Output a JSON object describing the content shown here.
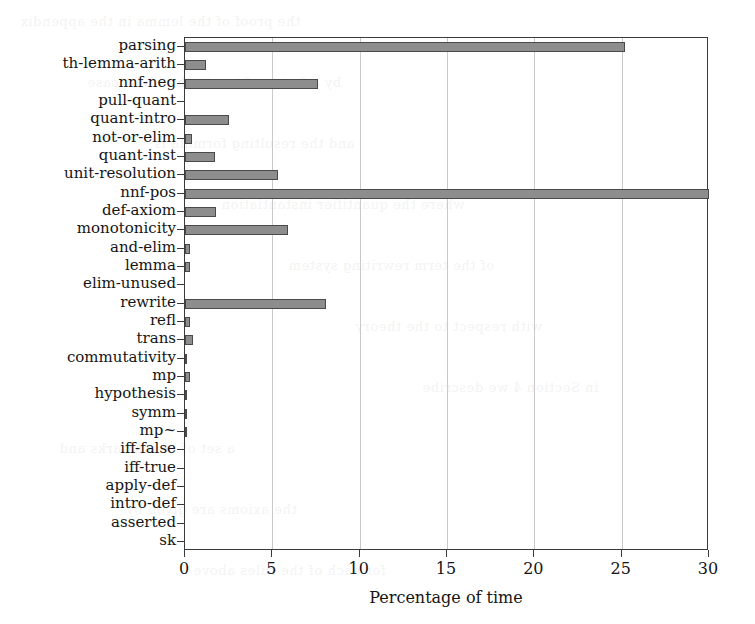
{
  "chart_data": {
    "type": "bar",
    "orientation": "horizontal",
    "title": "",
    "subtitle": "",
    "xlabel": "Percentage of time",
    "ylabel": "",
    "xlim": [
      0,
      30
    ],
    "xticks": [
      0,
      5,
      10,
      15,
      20,
      25,
      30
    ],
    "xtick_labels": [
      "0",
      "5",
      "10",
      "15",
      "20",
      "25",
      "30"
    ],
    "grid": "vertical",
    "legend": "none",
    "bar_color": "#8d8d8d",
    "bar_edge_color": "#4a4a4a",
    "axis_color": "#3a3a3a",
    "grid_color": "#c9c9c9",
    "categories": [
      "parsing",
      "th-lemma-arith",
      "nnf-neg",
      "pull-quant",
      "quant-intro",
      "not-or-elim",
      "quant-inst",
      "unit-resolution",
      "nnf-pos",
      "def-axiom",
      "monotonicity",
      "and-elim",
      "lemma",
      "elim-unused",
      "rewrite",
      "refl",
      "trans",
      "commutativity",
      "mp",
      "hypothesis",
      "symm",
      "mp~",
      "iff-false",
      "iff-true",
      "apply-def",
      "intro-def",
      "asserted",
      "sk"
    ],
    "values": [
      25.2,
      1.2,
      7.6,
      0.0,
      2.5,
      0.4,
      1.7,
      5.3,
      30.0,
      1.8,
      5.9,
      0.3,
      0.3,
      0.0,
      8.1,
      0.3,
      0.45,
      0.05,
      0.3,
      0.1,
      0.1,
      0.1,
      0.0,
      0.0,
      0.0,
      0.0,
      0.0,
      0.0
    ]
  },
  "bleed_text": [
    "the proof of the lemma in the appendix",
    "by a factor of two in the worst case",
    "and the resulting formula is",
    "where the quantifier instantiation",
    "of the term rewriting system",
    "with respect to the theory",
    "in Section 4 we describe",
    "a set of benchmarks and",
    "the axioms are given by",
    "for each of the rules above"
  ]
}
